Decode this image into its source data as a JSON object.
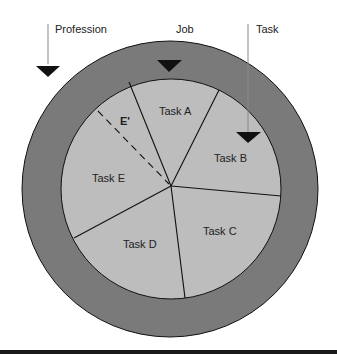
{
  "diagram": {
    "colors": {
      "outer_ring": "#7a7a7a",
      "inner_pie": "#bdbdbd",
      "stroke": "#111111",
      "background": "#ffffff"
    },
    "levels": [
      {
        "label": "Profession"
      },
      {
        "label": "Job"
      },
      {
        "label": "Task"
      }
    ],
    "tasks": [
      {
        "label": "Task A"
      },
      {
        "label": "Task B"
      },
      {
        "label": "Task C"
      },
      {
        "label": "Task D"
      },
      {
        "label": "Task E"
      }
    ],
    "subtask_label": "E'"
  }
}
